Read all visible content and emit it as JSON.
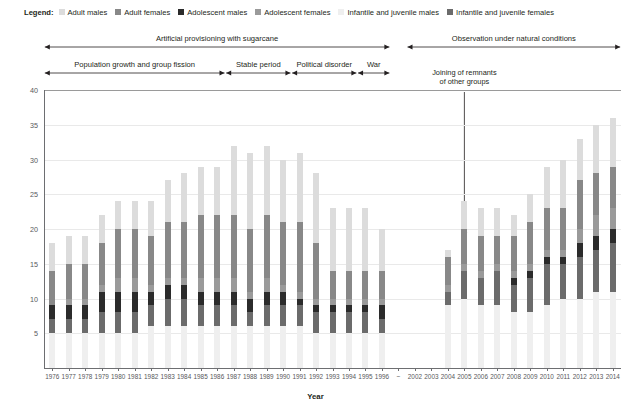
{
  "legend": {
    "title": "Legend:",
    "items": [
      {
        "label": "Adult males",
        "color": "#dcdcdc",
        "key": "adult_males"
      },
      {
        "label": "Adult females",
        "color": "#888888",
        "key": "adult_females"
      },
      {
        "label": "Adolescent males",
        "color": "#2b2b2b",
        "key": "adolescent_males"
      },
      {
        "label": "Adolescent females",
        "color": "#9a9a9a",
        "key": "adolescent_females"
      },
      {
        "label": "Infantile and juvenile males",
        "color": "#efefef",
        "key": "infantile_juvenile_males"
      },
      {
        "label": "Infantile and juvenile females",
        "color": "#6b6b6b",
        "key": "infantile_juvenile_females"
      }
    ]
  },
  "annotations": {
    "top_row": [
      {
        "label": "Artificial provisioning with sugarcane",
        "start_year": 1976,
        "end_year": 1996
      },
      {
        "label": "Observation under natural conditions",
        "start_year": 2002,
        "end_year": 2014
      }
    ],
    "bottom_row": [
      {
        "label": "Population growth and group fission",
        "start_year": 1976,
        "end_year": 1986
      },
      {
        "label": "Stable period",
        "start_year": 1987,
        "end_year": 1990
      },
      {
        "label": "Political disorder",
        "start_year": 1991,
        "end_year": 1994
      },
      {
        "label": "War",
        "start_year": 1995,
        "end_year": 1996
      }
    ],
    "callout": {
      "line1": "Joining of remnants",
      "line2": "of other groups",
      "target_year": 2005
    }
  },
  "chart_data": {
    "type": "bar",
    "stacked": true,
    "title": "",
    "xlabel": "Year",
    "ylabel": "Number of individuals",
    "ylim": [
      0,
      40
    ],
    "yticks": [
      0,
      5,
      10,
      15,
      20,
      25,
      30,
      35,
      40
    ],
    "ytick_labels": [
      "",
      "5",
      "10",
      "15",
      "20",
      "25",
      "30",
      "35",
      "40"
    ],
    "grid": true,
    "legend_position": "top",
    "categories": [
      "1976",
      "1977",
      "1978",
      "1979",
      "1980",
      "1981",
      "1982",
      "1983",
      "1984",
      "1985",
      "1986",
      "1987",
      "1988",
      "1989",
      "1990",
      "1991",
      "1992",
      "1993",
      "1994",
      "1995",
      "1996",
      "~",
      "2002",
      "2003",
      "2004",
      "2005",
      "2006",
      "2007",
      "2008",
      "2009",
      "2010",
      "2011",
      "2012",
      "2013",
      "2014"
    ],
    "gap_categories": [
      "~",
      "2002",
      "2003"
    ],
    "series": [
      {
        "name": "Infantile and juvenile males",
        "color": "#efefef",
        "values": [
          5,
          5,
          5,
          5,
          5,
          5,
          6,
          6,
          6,
          6,
          6,
          6,
          6,
          6,
          6,
          6,
          5,
          5,
          5,
          5,
          5,
          null,
          null,
          null,
          9,
          10,
          9,
          9,
          8,
          8,
          9,
          10,
          10,
          11,
          11
        ]
      },
      {
        "name": "Adult females",
        "color": "#888888",
        "values": [
          5,
          5,
          5,
          6,
          7,
          7,
          7,
          8,
          8,
          9,
          9,
          9,
          9,
          9,
          9,
          10,
          8,
          4,
          4,
          4,
          4,
          null,
          null,
          null,
          4,
          5,
          5,
          4,
          5,
          6,
          6,
          6,
          7,
          6,
          6
        ]
      },
      {
        "name": "Adolescent males",
        "color": "#2b2b2b",
        "values": [
          2,
          2,
          2,
          3,
          3,
          3,
          2,
          2,
          2,
          2,
          2,
          2,
          2,
          2,
          2,
          1,
          1,
          1,
          1,
          1,
          2,
          null,
          null,
          null,
          0,
          0,
          0,
          0,
          1,
          1,
          1,
          1,
          2,
          2,
          2
        ]
      },
      {
        "name": "Adolescent females",
        "color": "#9a9a9a",
        "values": [
          0,
          1,
          1,
          1,
          2,
          2,
          1,
          1,
          1,
          2,
          2,
          2,
          1,
          2,
          1,
          1,
          1,
          1,
          1,
          1,
          1,
          null,
          null,
          null,
          1,
          1,
          1,
          1,
          1,
          1,
          1,
          1,
          2,
          3,
          3
        ]
      },
      {
        "name": "Adult males",
        "color": "#dcdcdc",
        "values": [
          4,
          4,
          4,
          4,
          4,
          4,
          5,
          6,
          7,
          7,
          7,
          10,
          11,
          10,
          9,
          10,
          10,
          9,
          9,
          9,
          6,
          null,
          null,
          null,
          1,
          4,
          4,
          4,
          3,
          4,
          6,
          7,
          6,
          7,
          7
        ]
      },
      {
        "name": "Infantile and juvenile females",
        "color": "#6b6b6b",
        "values": [
          2,
          2,
          2,
          3,
          3,
          3,
          3,
          4,
          4,
          3,
          3,
          3,
          2,
          3,
          3,
          3,
          3,
          3,
          3,
          3,
          2,
          null,
          null,
          null,
          2,
          4,
          4,
          5,
          4,
          5,
          6,
          5,
          6,
          6,
          7
        ]
      }
    ],
    "totals": [
      18,
      19,
      19,
      22,
      24,
      24,
      24,
      27,
      28,
      29,
      29,
      32,
      31,
      32,
      30,
      31,
      28,
      23,
      23,
      23,
      20,
      null,
      null,
      null,
      17,
      24,
      23,
      23,
      22,
      25,
      29,
      30,
      33,
      35,
      36
    ]
  }
}
